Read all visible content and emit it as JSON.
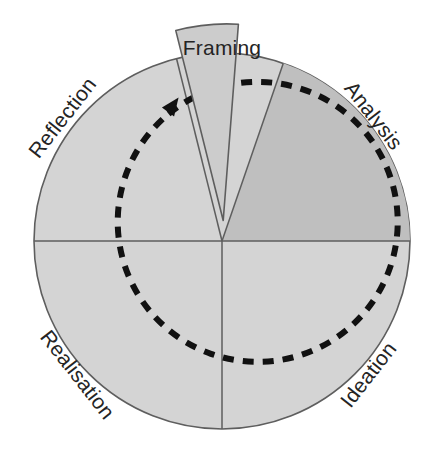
{
  "diagram": {
    "name": "design-cycle-wheel",
    "type": "radial-cycle",
    "direction": "clockwise",
    "center": {
      "x": 222,
      "y": 241
    },
    "outer_radius": 188,
    "dashed_radius": 140,
    "colors": {
      "background": "#ffffff",
      "sector_light": "#d4d4d4",
      "sector_dark": "#bfbfbf",
      "wedge_fill": "#cccccc",
      "outline": "#5e5e5e",
      "divider": "#5e5e5e",
      "dashed_arrow": "#111111",
      "label_text": "#242424"
    },
    "segments": [
      {
        "id": "framing",
        "label": "Framing",
        "position": "top",
        "exploded": true,
        "start_angle_deg": -14,
        "end_angle_deg": 19,
        "fill": "#cccccc",
        "label_rotation_deg": 0
      },
      {
        "id": "analysis",
        "label": "Analysis",
        "position": "upper-right",
        "exploded": false,
        "start_angle_deg": 19,
        "end_angle_deg": 90,
        "fill": "#bfbfbf",
        "label_rotation_deg": 52
      },
      {
        "id": "ideation",
        "label": "Ideation",
        "position": "lower-right",
        "exploded": false,
        "start_angle_deg": 90,
        "end_angle_deg": 180,
        "fill": "#d4d4d4",
        "label_rotation_deg": -52
      },
      {
        "id": "realisation",
        "label": "Realisation",
        "position": "lower-left",
        "exploded": false,
        "start_angle_deg": 180,
        "end_angle_deg": 270,
        "fill": "#d4d4d4",
        "label_rotation_deg": 52
      },
      {
        "id": "reflection",
        "label": "Reflection",
        "position": "upper-left",
        "exploded": false,
        "start_angle_deg": 270,
        "end_angle_deg": 346,
        "fill": "#d4d4d4",
        "label_rotation_deg": -52
      }
    ],
    "flow_arrow": {
      "id": "cycle-arrow",
      "style": "dashed",
      "shape": "circle",
      "direction": "clockwise",
      "head_position": {
        "x": 163,
        "y": 110
      },
      "dash_pattern": "11 9",
      "stroke_width": 6
    },
    "dividers": [
      {
        "id": "horizontal-diameter",
        "from": "left",
        "to": "right"
      },
      {
        "id": "vertical-lower-radius",
        "from": "center",
        "to": "bottom"
      }
    ]
  }
}
